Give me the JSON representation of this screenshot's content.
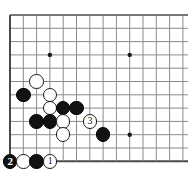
{
  "figure": {
    "kind": "go-board-diagram",
    "title": "",
    "background_color": "#ffffff"
  },
  "board": {
    "grid_origin_x": 10,
    "grid_origin_y": 15,
    "spacing": 13.3,
    "cols_visible": 13,
    "rows_visible": 12,
    "line_color": "#8a8a8a",
    "edge_color": "#4a4a4a",
    "edge_width": 2,
    "line_width": 1,
    "star_point_color": "#1a1a1a",
    "star_point_radius": 2.2,
    "star_points": [
      {
        "col": 3,
        "row": 3
      },
      {
        "col": 9,
        "row": 3
      },
      {
        "col": 9,
        "row": 9
      }
    ]
  },
  "stones": [
    {
      "id": "w-c2r5",
      "color": "white",
      "col": 2,
      "row": 5,
      "label": ""
    },
    {
      "id": "b-c1r6",
      "color": "black",
      "col": 1,
      "row": 6,
      "label": ""
    },
    {
      "id": "w-c3r6",
      "color": "white",
      "col": 3,
      "row": 6,
      "label": ""
    },
    {
      "id": "w-c3r7",
      "color": "white",
      "col": 3,
      "row": 7,
      "label": ""
    },
    {
      "id": "b-c4r7",
      "color": "black",
      "col": 4,
      "row": 7,
      "label": ""
    },
    {
      "id": "b-c5r7",
      "color": "black",
      "col": 5,
      "row": 7,
      "label": ""
    },
    {
      "id": "b-c2r8",
      "color": "black",
      "col": 2,
      "row": 8,
      "label": ""
    },
    {
      "id": "b-c3r8",
      "color": "black",
      "col": 3,
      "row": 8,
      "label": ""
    },
    {
      "id": "w-c4r8",
      "color": "white",
      "col": 4,
      "row": 8,
      "label": ""
    },
    {
      "id": "w-c6r8",
      "color": "white",
      "col": 6,
      "row": 8,
      "label": "3"
    },
    {
      "id": "w-c4r9",
      "color": "white",
      "col": 4,
      "row": 9,
      "label": ""
    },
    {
      "id": "b-c7r9",
      "color": "black",
      "col": 7,
      "row": 9,
      "label": ""
    },
    {
      "id": "b-c0r11",
      "color": "black",
      "col": 0,
      "row": 11,
      "label": "2"
    },
    {
      "id": "w-c1r11",
      "color": "white",
      "col": 1,
      "row": 11,
      "label": ""
    },
    {
      "id": "b-c2r11",
      "color": "black",
      "col": 2,
      "row": 11,
      "label": ""
    },
    {
      "id": "w-c3r11",
      "color": "white",
      "col": 3,
      "row": 11,
      "label": "1"
    }
  ],
  "move_labels": {
    "move_1": "1",
    "move_2": "2",
    "move_3": "3"
  },
  "colors": {
    "black_stone": "#121212",
    "white_stone": "#ffffff",
    "stone_outline": "#1a1a1a",
    "grid_line": "#8a8a8a",
    "board_edge": "#4a4a4a",
    "black_label_text": "#ffffff",
    "white_label_text": "#111111"
  }
}
